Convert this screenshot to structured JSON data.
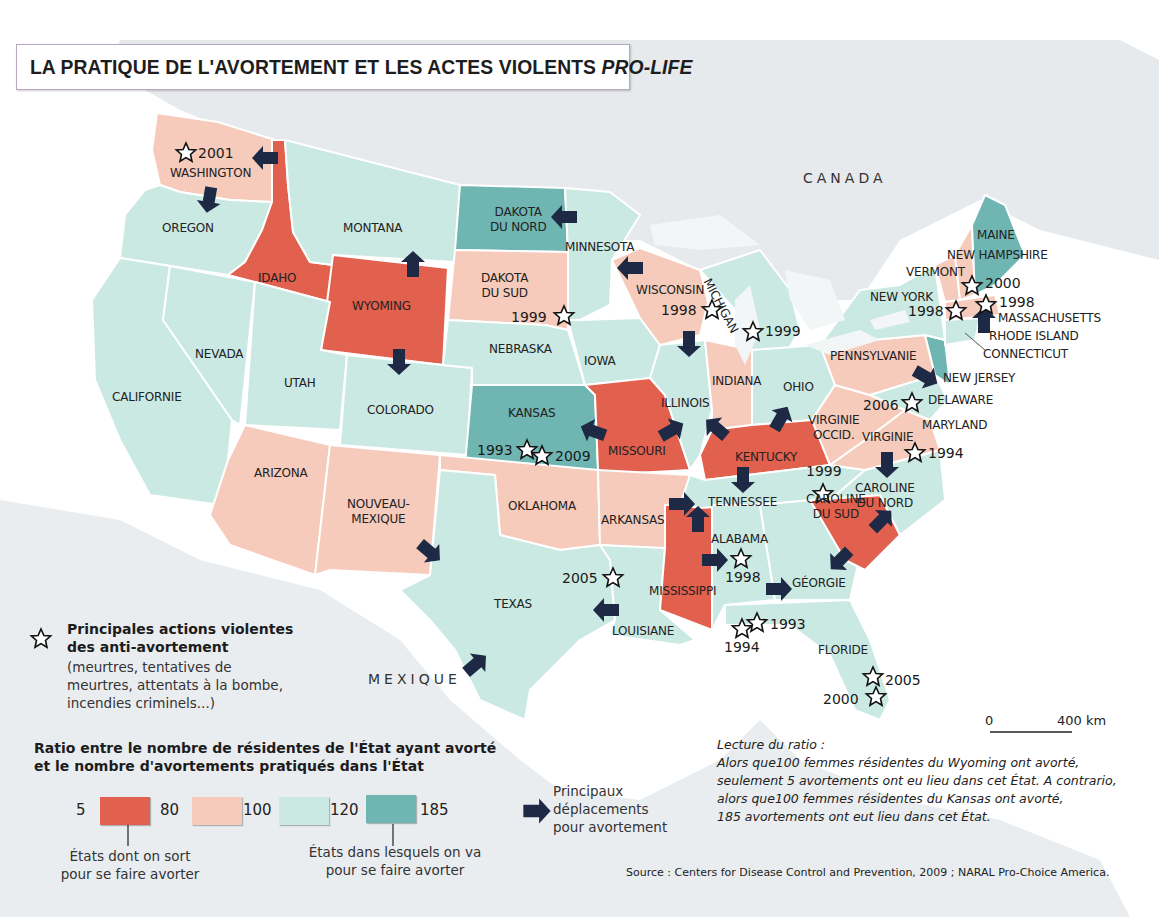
{
  "title": {
    "main": "LA PRATIQUE DE L'AVORTEMENT ET LES ACTES VIOLENTS ",
    "italic": "PRO-LIFE"
  },
  "colors": {
    "cat_5_80": "#e2604e",
    "cat_80_100": "#f6cbbb",
    "cat_100_120": "#cbe9e3",
    "cat_120_185": "#6fb5b2",
    "arrow": "#1e2a45",
    "land_bg": "#e4e9ec"
  },
  "countries": {
    "canada": "CANADA",
    "mexique": "MEXIQUE"
  },
  "states": {
    "washington": {
      "label": "WASHINGTON",
      "category": "80-100"
    },
    "oregon": {
      "label": "OREGON",
      "category": "100-120"
    },
    "idaho": {
      "label": "IDAHO",
      "category": "5-80"
    },
    "montana": {
      "label": "MONTANA",
      "category": "100-120"
    },
    "wyoming": {
      "label": "WYOMING",
      "category": "5-80"
    },
    "dakota_nord": {
      "label": "DAKOTA\nDU NORD",
      "category": "120-185"
    },
    "dakota_sud": {
      "label": "DAKOTA\nDU SUD",
      "category": "80-100"
    },
    "minnesota": {
      "label": "MINNESOTA",
      "category": "100-120"
    },
    "wisconsin": {
      "label": "WISCONSIN",
      "category": "80-100"
    },
    "michigan": {
      "label": "MICHIGAN",
      "category": "100-120"
    },
    "nevada": {
      "label": "NEVADA",
      "category": "100-120"
    },
    "californie": {
      "label": "CALIFORNIE",
      "category": "100-120"
    },
    "utah": {
      "label": "UTAH",
      "category": "100-120"
    },
    "colorado": {
      "label": "COLORADO",
      "category": "100-120"
    },
    "nebraska": {
      "label": "NEBRASKA",
      "category": "100-120"
    },
    "iowa": {
      "label": "IOWA",
      "category": "100-120"
    },
    "kansas": {
      "label": "KANSAS",
      "category": "120-185"
    },
    "missouri": {
      "label": "MISSOURI",
      "category": "5-80"
    },
    "illinois": {
      "label": "ILLINOIS",
      "category": "100-120"
    },
    "indiana": {
      "label": "INDIANA",
      "category": "80-100"
    },
    "ohio": {
      "label": "OHIO",
      "category": "100-120"
    },
    "arizona": {
      "label": "ARIZONA",
      "category": "80-100"
    },
    "nouveau_mexique": {
      "label": "NOUVEAU-\nMEXIQUE",
      "category": "80-100"
    },
    "oklahoma": {
      "label": "OKLAHOMA",
      "category": "80-100"
    },
    "arkansas": {
      "label": "ARKANSAS",
      "category": "80-100"
    },
    "texas": {
      "label": "TEXAS",
      "category": "100-120"
    },
    "louisiane": {
      "label": "LOUISIANE",
      "category": "100-120"
    },
    "mississippi": {
      "label": "MISSISSIPPI",
      "category": "5-80"
    },
    "alabama": {
      "label": "ALABAMA",
      "category": "100-120"
    },
    "tennessee": {
      "label": "TENNESSEE",
      "category": "100-120"
    },
    "kentucky": {
      "label": "KENTUCKY",
      "category": "5-80"
    },
    "georgie": {
      "label": "GÉORGIE",
      "category": "100-120"
    },
    "floride": {
      "label": "FLORIDE",
      "category": "100-120"
    },
    "caroline_sud": {
      "label": "CAROLINE\nDU SUD",
      "category": "5-80"
    },
    "caroline_nord": {
      "label": "CAROLINE\nDU NORD",
      "category": "100-120"
    },
    "virginie": {
      "label": "VIRGINIE",
      "category": "80-100"
    },
    "virginie_occ": {
      "label": "VIRGINIE\nOCCID.",
      "category": "80-100"
    },
    "pennsylvanie": {
      "label": "PENNSYLVANIE",
      "category": "80-100"
    },
    "new_york": {
      "label": "NEW YORK",
      "category": "100-120"
    },
    "vermont": {
      "label": "VERMONT",
      "category": "80-100"
    },
    "new_hampshire": {
      "label": "NEW HAMPSHIRE",
      "category": "80-100"
    },
    "maine": {
      "label": "MAINE",
      "category": "120-185"
    },
    "massachusetts": {
      "label": "MASSACHUSETTS",
      "category": "80-100"
    },
    "rhode_island": {
      "label": "RHODE ISLAND",
      "category": "120-185"
    },
    "connecticut": {
      "label": "CONNECTICUT",
      "category": "100-120"
    },
    "new_jersey": {
      "label": "NEW JERSEY",
      "category": "120-185"
    },
    "delaware": {
      "label": "DELAWARE",
      "category": "100-120"
    },
    "maryland": {
      "label": "MARYLAND",
      "category": "100-120"
    }
  },
  "violent_actions": [
    {
      "state": "Washington",
      "year": "2001"
    },
    {
      "state": "Dakota du Sud",
      "year": "1999"
    },
    {
      "state": "Wisconsin",
      "year": "1998"
    },
    {
      "state": "Michigan",
      "year": "1999"
    },
    {
      "state": "Kansas",
      "year": "1993"
    },
    {
      "state": "Kansas",
      "year": "2009"
    },
    {
      "state": "Vermont",
      "year": "2000"
    },
    {
      "state": "New York",
      "year": "1998"
    },
    {
      "state": "Massachusetts",
      "year": "1998"
    },
    {
      "state": "Maryland",
      "year": "2006"
    },
    {
      "state": "Virginie",
      "year": "1994"
    },
    {
      "state": "Caroline du Nord",
      "year": "1999"
    },
    {
      "state": "Alabama",
      "year": "1998"
    },
    {
      "state": "Louisiane",
      "year": "2005"
    },
    {
      "state": "Floride",
      "year": "1993"
    },
    {
      "state": "Floride",
      "year": "1994"
    },
    {
      "state": "Floride",
      "year": "2005"
    },
    {
      "state": "Floride",
      "year": "2000"
    }
  ],
  "legend": {
    "star_title": "Principales actions violentes\ndes anti-avortement",
    "star_desc": "(meurtres, tentatives de\nmeurtres, attentats à la bombe,\nincendies criminels...)",
    "ratio_title": "Ratio entre le nombre de résidentes de l'État ayant avorté\net le nombre d'avortements pratiqués dans l'État",
    "breaks": [
      "5",
      "80",
      "100",
      "120",
      "185"
    ],
    "leave_label": "États dont on sort\npour se faire avorter",
    "go_label": "États dans lesquels on va\npour se faire avorter",
    "arrow_label": "Principaux\ndéplacements\npour avortement"
  },
  "scale": {
    "zero": "0",
    "distance": "400 km"
  },
  "reading_note": {
    "title": "Lecture du ratio :",
    "body": "Alors que100 femmes résidentes du Wyoming ont avorté,\nseulement 5 avortements ont eu lieu dans cet État. A contrario,\nalors que100 femmes résidentes du Kansas ont avorté,\n185 avortements ont eut lieu dans cet État."
  },
  "source": "Source : Centers for Disease Control and Prevention, 2009 ; NARAL Pro-Choice America."
}
